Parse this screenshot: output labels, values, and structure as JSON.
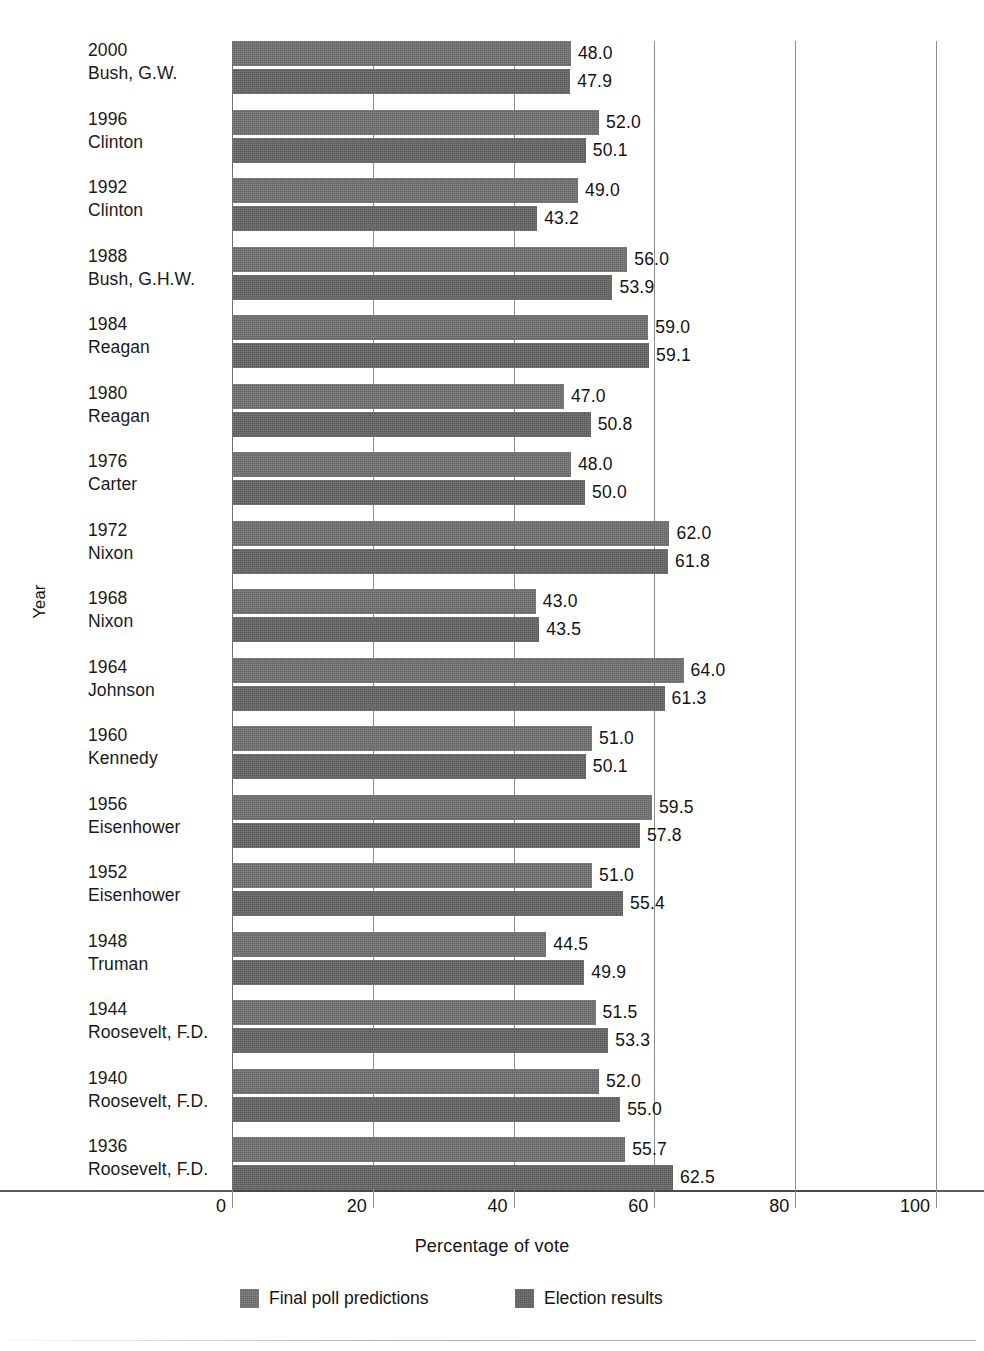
{
  "chart_data": {
    "type": "bar",
    "orientation": "horizontal",
    "title": "",
    "xlabel": "Percentage of vote",
    "ylabel": "Year",
    "xlim": [
      0,
      100
    ],
    "xticks": [
      0,
      20,
      40,
      60,
      80,
      100
    ],
    "xtick_labels": [
      "0",
      "20",
      "40",
      "60",
      "80",
      "100"
    ],
    "grid": "vertical",
    "legend_position": "bottom",
    "categories": [
      "2000\nBush, G.W.",
      "1996\nClinton",
      "1992\nClinton",
      "1988\nBush, G.H.W.",
      "1984\nReagan",
      "1980\nReagan",
      "1976\nCarter",
      "1972\nNixon",
      "1968\nNixon",
      "1964\nJohnson",
      "1960\nKennedy",
      "1956\nEisenhower",
      "1952\nEisenhower",
      "1948\nTruman",
      "1944\nRoosevelt, F.D.",
      "1940\nRoosevelt, F.D.",
      "1936\nRoosevelt, F.D."
    ],
    "series": [
      {
        "name": "Final poll predictions",
        "values": [
          48.0,
          52.0,
          49.0,
          56.0,
          59.0,
          47.0,
          48.0,
          62.0,
          43.0,
          64.0,
          51.0,
          59.5,
          51.0,
          44.5,
          51.5,
          52.0,
          55.7
        ]
      },
      {
        "name": "Election results",
        "values": [
          47.9,
          50.1,
          43.2,
          53.9,
          59.1,
          50.8,
          50.0,
          61.8,
          43.5,
          61.3,
          50.1,
          57.8,
          55.4,
          49.9,
          53.3,
          55.0,
          62.5
        ]
      }
    ]
  },
  "groups": [
    {
      "year": "2000",
      "name": "Bush, G.W.",
      "prediction": "48.0",
      "result": "47.9"
    },
    {
      "year": "1996",
      "name": "Clinton",
      "prediction": "52.0",
      "result": "50.1"
    },
    {
      "year": "1992",
      "name": "Clinton",
      "prediction": "49.0",
      "result": "43.2"
    },
    {
      "year": "1988",
      "name": "Bush, G.H.W.",
      "prediction": "56.0",
      "result": "53.9"
    },
    {
      "year": "1984",
      "name": "Reagan",
      "prediction": "59.0",
      "result": "59.1"
    },
    {
      "year": "1980",
      "name": "Reagan",
      "prediction": "47.0",
      "result": "50.8"
    },
    {
      "year": "1976",
      "name": "Carter",
      "prediction": "48.0",
      "result": "50.0"
    },
    {
      "year": "1972",
      "name": "Nixon",
      "prediction": "62.0",
      "result": "61.8"
    },
    {
      "year": "1968",
      "name": "Nixon",
      "prediction": "43.0",
      "result": "43.5"
    },
    {
      "year": "1964",
      "name": "Johnson",
      "prediction": "64.0",
      "result": "61.3"
    },
    {
      "year": "1960",
      "name": "Kennedy",
      "prediction": "51.0",
      "result": "50.1"
    },
    {
      "year": "1956",
      "name": "Eisenhower",
      "prediction": "59.5",
      "result": "57.8"
    },
    {
      "year": "1952",
      "name": "Eisenhower",
      "prediction": "51.0",
      "result": "55.4"
    },
    {
      "year": "1948",
      "name": "Truman",
      "prediction": "44.5",
      "result": "49.9"
    },
    {
      "year": "1944",
      "name": "Roosevelt, F.D.",
      "prediction": "51.5",
      "result": "53.3"
    },
    {
      "year": "1940",
      "name": "Roosevelt, F.D.",
      "prediction": "52.0",
      "result": "55.0"
    },
    {
      "year": "1936",
      "name": "Roosevelt, F.D.",
      "prediction": "55.7",
      "result": "62.5"
    }
  ],
  "axis": {
    "x_title": "Percentage of vote",
    "y_title": "Year",
    "x_ticks": [
      "0",
      "20",
      "40",
      "60",
      "80",
      "100"
    ]
  },
  "legend": [
    {
      "label": "Final poll predictions"
    },
    {
      "label": "Election results"
    }
  ],
  "colors": {
    "series_1": "#727272",
    "series_2": "#666666",
    "grid": "#8d8d8d",
    "axis": "#5c5c5c",
    "text": "#121212",
    "background": "#ffffff"
  }
}
